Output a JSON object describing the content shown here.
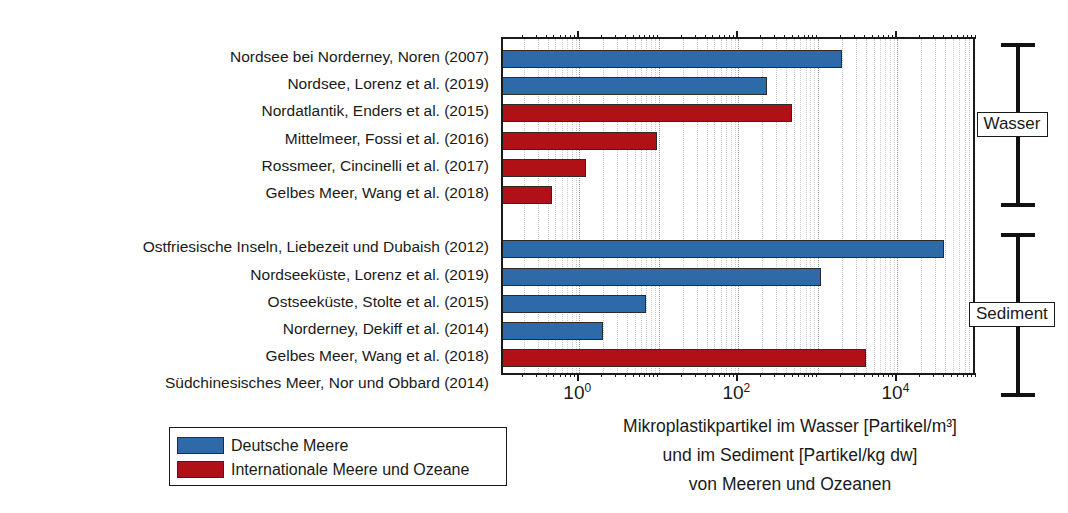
{
  "chart_data": {
    "type": "bar",
    "orientation": "horizontal",
    "xscale": "log",
    "xlim": [
      0.11,
      100000
    ],
    "grid": true,
    "legend_position": "bottom-left",
    "title": "",
    "xlabel": "Mikroplastikpartikel im Wasser [Partikel/m³] und im Sediment [Partikel/kg dw] von Meeren und Ozeanen",
    "ylabel": "",
    "xtick_labels": [
      "10⁰",
      "10²",
      "10⁴"
    ],
    "xtick_values": [
      1,
      100,
      10000
    ],
    "categories": [
      "Nordsee bei Norderney, Noren (2007)",
      "Nordsee, Lorenz et al. (2019)",
      "Nordatlantik, Enders et al. (2015)",
      "Mittelmeer, Fossi et al. (2016)",
      "Rossmeer, Cincinelli et al. (2017)",
      "Gelbes Meer, Wang et al. (2018)",
      "Ostfriesische Inseln, Liebezeit und Dubaish (2012)",
      "Nordseeküste, Lorenz et al. (2019)",
      "Ostseeküste, Stolte et al. (2015)",
      "Norderney, Dekiff et al. (2014)",
      "Gelbes Meer, Wang et al. (2018)",
      "Südchinesisches Meer, Nor und Obbard (2014)"
    ],
    "values": [
      2000,
      230,
      470,
      9.5,
      1.2,
      0.45,
      38000,
      1100,
      7,
      2,
      4000,
      35
    ],
    "series": [
      {
        "name": "Deutsche Meere",
        "color": "#2e69a8",
        "points": [
          {
            "category": "Nordsee bei Norderney, Noren (2007)",
            "value": 2000,
            "group": "Wasser"
          },
          {
            "category": "Nordsee, Lorenz et al. (2019)",
            "value": 230,
            "group": "Wasser"
          },
          {
            "category": "Ostfriesische Inseln, Liebezeit und Dubaish (2012)",
            "value": 38000,
            "group": "Sediment"
          },
          {
            "category": "Nordseeküste, Lorenz et al. (2019)",
            "value": 1100,
            "group": "Sediment"
          },
          {
            "category": "Ostseeküste, Stolte et al. (2015)",
            "value": 7,
            "group": "Sediment"
          },
          {
            "category": "Norderney, Dekiff et al. (2014)",
            "value": 2,
            "group": "Sediment"
          }
        ]
      },
      {
        "name": "Internationale Meere und Ozeane",
        "color": "#b01117",
        "points": [
          {
            "category": "Nordatlantik, Enders et al. (2015)",
            "value": 470,
            "group": "Wasser"
          },
          {
            "category": "Mittelmeer, Fossi et al. (2016)",
            "value": 9.5,
            "group": "Wasser"
          },
          {
            "category": "Rossmeer, Cincinelli et al. (2017)",
            "value": 1.2,
            "group": "Wasser"
          },
          {
            "category": "Gelbes Meer, Wang et al. (2018)",
            "value": 0.45,
            "group": "Wasser"
          },
          {
            "category": "Gelbes Meer, Wang et al. (2018)",
            "value": 4000,
            "group": "Sediment"
          },
          {
            "category": "Südchinesisches Meer, Nor und Obbard (2014)",
            "value": 35,
            "group": "Sediment"
          }
        ]
      }
    ],
    "bars": [
      {
        "label": "Nordsee bei Norderney, Noren (2007)",
        "value": 2000,
        "color": "blue",
        "group": "Wasser"
      },
      {
        "label": "Nordsee, Lorenz et al. (2019)",
        "value": 230,
        "color": "blue",
        "group": "Wasser"
      },
      {
        "label": "Nordatlantik, Enders et al. (2015)",
        "value": 470,
        "color": "red",
        "group": "Wasser"
      },
      {
        "label": "Mittelmeer, Fossi et al. (2016)",
        "value": 9.5,
        "color": "red",
        "group": "Wasser"
      },
      {
        "label": "Rossmeer, Cincinelli et al. (2017)",
        "value": 1.2,
        "color": "red",
        "group": "Wasser"
      },
      {
        "label": "Gelbes Meer, Wang et al. (2018)",
        "value": 0.45,
        "color": "red",
        "group": "Wasser"
      },
      {
        "label": "Ostfriesische Inseln, Liebezeit und Dubaish (2012)",
        "value": 38000,
        "color": "blue",
        "group": "Sediment"
      },
      {
        "label": "Nordseeküste, Lorenz et al. (2019)",
        "value": 1100,
        "color": "blue",
        "group": "Sediment"
      },
      {
        "label": "Ostseeküste, Stolte et al. (2015)",
        "value": 7,
        "color": "blue",
        "group": "Sediment"
      },
      {
        "label": "Norderney, Dekiff et al. (2014)",
        "value": 2,
        "color": "blue",
        "group": "Sediment"
      },
      {
        "label": "Gelbes Meer, Wang et al. (2018)",
        "value": 4000,
        "color": "red",
        "group": "Sediment"
      },
      {
        "label": "Südchinesisches Meer, Nor und Obbard (2014)",
        "value": 35,
        "color": "red",
        "group": "Sediment"
      }
    ],
    "group_brackets": [
      {
        "label": "Wasser",
        "from_index": 0,
        "to_index": 5
      },
      {
        "label": "Sediment",
        "from_index": 6,
        "to_index": 11
      }
    ],
    "legend": [
      {
        "label": "Deutsche Meere",
        "color": "#2e69a8"
      },
      {
        "label": "Internationale Meere und Ozeane",
        "color": "#b01117"
      }
    ],
    "axis_title_lines": [
      "Mikroplastikpartikel im Wasser [Partikel/m³]",
      "und im Sediment [Partikel/kg dw]",
      "von Meeren und Ozeanen"
    ],
    "colors": {
      "blue": "#2e69a8",
      "red": "#b01117",
      "axis": "#1a1a1a",
      "grid": "#c9c9c9",
      "background": "#ffffff"
    }
  }
}
